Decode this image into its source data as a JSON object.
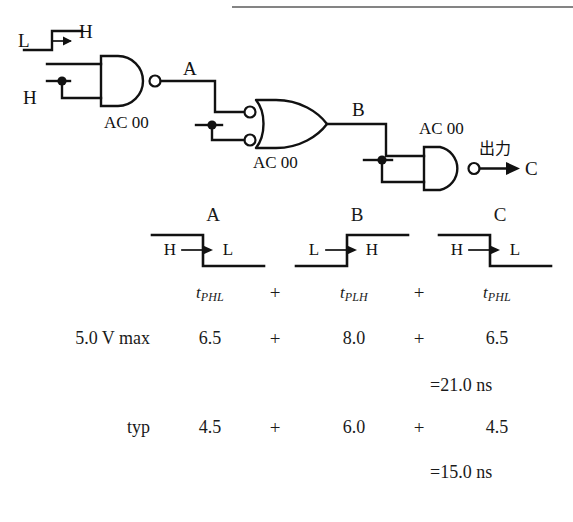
{
  "figure": {
    "type": "logic-circuit-timing-diagram",
    "ink_color": "#111111",
    "background": "#ffffff"
  },
  "circuit": {
    "input_waveform": {
      "from": "L",
      "to": "H",
      "edge": "rising"
    },
    "static_input_label": "H",
    "gates": [
      {
        "id": "gate1",
        "part": "AC 00",
        "shape": "nand",
        "output_signal": "A"
      },
      {
        "id": "gate2",
        "part": "AC 00",
        "shape": "negative-input-or",
        "output_signal": "B"
      },
      {
        "id": "gate3",
        "part": "AC 00",
        "shape": "nand",
        "output_signal": "C"
      }
    ],
    "node_labels": {
      "a": "A",
      "b": "B",
      "c": "C"
    },
    "output_caption": "出力"
  },
  "table": {
    "columns": [
      {
        "signal": "A",
        "waveform": {
          "from": "H",
          "to": "L",
          "edge": "falling"
        },
        "delay_symbol_base": "t",
        "delay_symbol_sub": "PHL",
        "max_value": "6.5",
        "typ_value": "4.5"
      },
      {
        "signal": "B",
        "waveform": {
          "from": "L",
          "to": "H",
          "edge": "rising"
        },
        "delay_symbol_base": "t",
        "delay_symbol_sub": "PLH",
        "max_value": "8.0",
        "typ_value": "6.0"
      },
      {
        "signal": "C",
        "waveform": {
          "from": "H",
          "to": "L",
          "edge": "falling"
        },
        "delay_symbol_base": "t",
        "delay_symbol_sub": "PHL",
        "max_value": "6.5",
        "typ_value": "4.5"
      }
    ],
    "operator": "+",
    "rows": [
      {
        "label": "5.0 V max",
        "total": "=21.0 ns"
      },
      {
        "label": "typ",
        "total": "=15.0 ns"
      }
    ]
  }
}
